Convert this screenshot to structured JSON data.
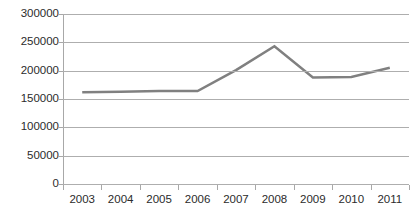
{
  "chart_data": {
    "type": "line",
    "title": "",
    "xlabel": "",
    "ylabel": "",
    "categories": [
      "2003",
      "2004",
      "2005",
      "2006",
      "2007",
      "2008",
      "2009",
      "2010",
      "2011"
    ],
    "values": [
      162000,
      163000,
      164000,
      164000,
      201000,
      243000,
      188000,
      189000,
      205000
    ],
    "series": [
      {
        "name": "",
        "color": "#808080",
        "values": [
          162000,
          163000,
          164000,
          164000,
          201000,
          243000,
          188000,
          189000,
          205000
        ]
      }
    ],
    "ylim": [
      0,
      300000
    ],
    "ytick_step": 50000,
    "yticks": [
      300000,
      250000,
      200000,
      150000,
      100000,
      50000,
      0
    ],
    "ytick_labels": [
      "300000",
      "250000",
      "200000",
      "150000",
      "100000",
      "50000",
      "0"
    ],
    "grid": "horizontal",
    "legend": "none",
    "markers": false,
    "line_width": 2.5,
    "gridline_color": "#aeaeae",
    "axis_color": "#a8a8a8",
    "text_color": "#2b2b2b",
    "background": "#ffffff"
  }
}
